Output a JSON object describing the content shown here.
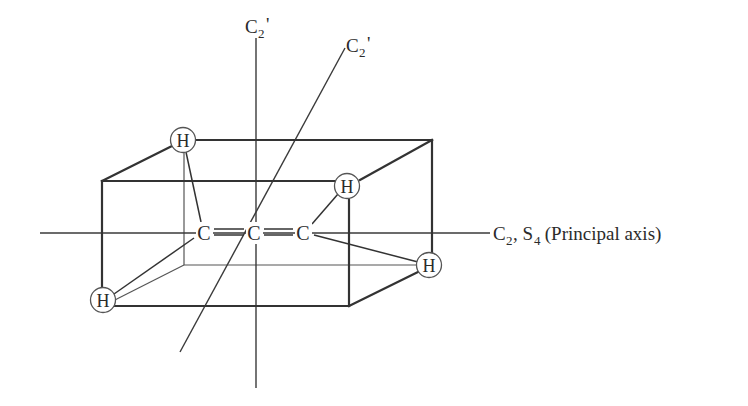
{
  "figure": {
    "molecule": {
      "carbons": [
        {
          "label": "C",
          "x": 204,
          "y": 233
        },
        {
          "label": "C",
          "x": 254,
          "y": 233
        },
        {
          "label": "C",
          "x": 303,
          "y": 233
        }
      ],
      "double_bond_symbol": "=",
      "hydrogens": [
        {
          "label": "H",
          "x": 183,
          "y": 140
        },
        {
          "label": "H",
          "x": 103,
          "y": 300
        },
        {
          "label": "H",
          "x": 347,
          "y": 186
        },
        {
          "label": "H",
          "x": 429,
          "y": 265
        }
      ]
    },
    "axes": {
      "principal": {
        "label_main": "C",
        "label_sub": "2",
        "label_sep": ", S",
        "label_sub2": "4",
        "label_rest": " (Principal axis)"
      },
      "c2_vertical": {
        "label_main": "C",
        "label_sub": "2",
        "label_prime": "'"
      },
      "c2_diagonal": {
        "label_main": "C",
        "label_sub": "2",
        "label_prime": "'"
      }
    },
    "colors": {
      "line": "#333333",
      "background": "#ffffff"
    }
  }
}
